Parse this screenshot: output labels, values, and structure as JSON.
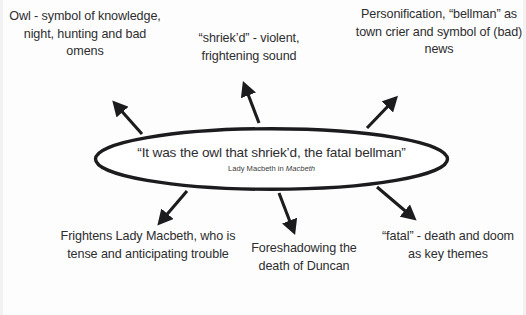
{
  "diagram": {
    "center": {
      "quote": "“It was the owl that shriek’d, the fatal bellman”",
      "attribution_prefix": "Lady Macbeth in ",
      "attribution_work": "Macbeth"
    },
    "notes": [
      {
        "id": "owl",
        "text": "Owl - symbol of knowledge, night, hunting and bad omens"
      },
      {
        "id": "shriek",
        "text": "“shriek’d” - violent, frightening sound"
      },
      {
        "id": "bellman",
        "text": "Personification, “bellman” as town crier and symbol of (bad) news"
      },
      {
        "id": "frightens",
        "text": "Frightens Lady Macbeth, who is tense and anticipating trouble"
      },
      {
        "id": "foreshadow",
        "text": "Foreshadowing the death of Duncan"
      },
      {
        "id": "fatal",
        "text": "“fatal” - death and doom as key themes"
      }
    ],
    "colors": {
      "ink": "#2d2d2f",
      "stroke": "#1c1c1e",
      "background": "#fdfdfd"
    }
  }
}
